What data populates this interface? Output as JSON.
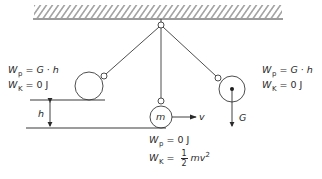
{
  "diagram": {
    "type": "pendulum-energy",
    "colors": {
      "stroke": "#3a3a3a",
      "text": "#2a2a2a",
      "background": "#ffffff"
    },
    "left_state": {
      "wp_symbol": "W",
      "wp_sub": "p",
      "wp_eq": "= ",
      "wp_value_G": "G",
      "wp_dot": " · ",
      "wp_value_h": "h",
      "wk_symbol": "W",
      "wk_sub": "K",
      "wk_eq": "= ",
      "wk_value": "0 J"
    },
    "right_state": {
      "wp_symbol": "W",
      "wp_sub": "p",
      "wp_eq": "= ",
      "wp_value_G": "G",
      "wp_dot": " · ",
      "wp_value_h": "h",
      "wk_symbol": "W",
      "wk_sub": "K",
      "wk_eq": "= ",
      "wk_value": "0 J"
    },
    "bottom_state": {
      "wp_symbol": "W",
      "wp_sub": "p",
      "wp_eq": "= ",
      "wp_value": "0  J",
      "wk_symbol": "W",
      "wk_sub": "K",
      "wk_eq": "= ",
      "frac_num": "1",
      "frac_den": "2",
      "wk_mv": "mv",
      "wk_exp": "2"
    },
    "labels": {
      "height": "h",
      "mass": "m",
      "velocity": "v",
      "weight": "G"
    }
  }
}
